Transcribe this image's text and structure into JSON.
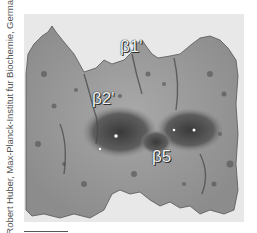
{
  "figure": {
    "credit": "Robert Huber, Max-Planck-Institut fur Biochemie, Germany.",
    "labels": {
      "beta1": "β1'",
      "beta2": "β2'",
      "beta5": "β5"
    },
    "colors": {
      "background": "#e8e8e8",
      "surface": "#9a9a9a",
      "surface_dark": "#4a4a4a",
      "label_text": "#f2f2f2"
    }
  }
}
